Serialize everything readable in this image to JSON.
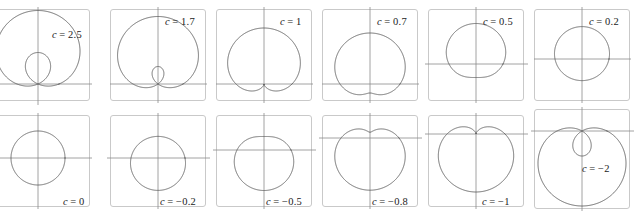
{
  "figure": {
    "width": 636,
    "height": 211,
    "columns": 6,
    "rows": 2,
    "background_color": "#ffffff",
    "curve_color": "#5c5c5c",
    "axis_color": "#8a8a8a",
    "frame_color": "#c9c9c9",
    "label_color": "#1a1a1a"
  },
  "chart_data": {
    "type": "line",
    "xlabel": "",
    "ylabel": "",
    "grid": false,
    "legend_position": "none",
    "equation": "r = 1 + c sin(theta)",
    "parameter_name": "c",
    "panels": [
      {
        "index": 0,
        "label_var": "c",
        "label_eq": "= 2.5",
        "c": 2.5,
        "label_x": 52,
        "label_y": 29,
        "frame": {
          "x": -22,
          "y": 9,
          "w": 112,
          "h": 92
        },
        "origin_x": 38,
        "origin_y": 84,
        "scale": 21,
        "axis_h": {
          "x1": -24,
          "x2": 92,
          "y": 84
        },
        "axis_v": {
          "y1": 7,
          "y2": 105,
          "x": 38
        },
        "shape": "limacon-with-inner-loop"
      },
      {
        "index": 1,
        "label_var": "c",
        "label_eq": "= 1.7",
        "c": 1.7,
        "label_x": 59,
        "label_y": 16,
        "frame": {
          "x": 4,
          "y": 9,
          "w": 96,
          "h": 92
        },
        "origin_x": 52,
        "origin_y": 84,
        "scale": 25,
        "axis_h": {
          "x1": 4,
          "x2": 101,
          "y": 84
        },
        "axis_v": {
          "y1": 7,
          "y2": 103,
          "x": 52
        },
        "shape": "limacon-with-inner-loop"
      },
      {
        "index": 2,
        "label_var": "c",
        "label_eq": "= 1",
        "c": 1.0,
        "label_x": 68,
        "label_y": 16,
        "frame": {
          "x": 4,
          "y": 9,
          "w": 96,
          "h": 92
        },
        "origin_x": 52,
        "origin_y": 84,
        "scale": 28,
        "axis_h": {
          "x1": 4,
          "x2": 101,
          "y": 84
        },
        "axis_v": {
          "y1": 7,
          "y2": 103,
          "x": 52
        },
        "shape": "cardioid"
      },
      {
        "index": 3,
        "label_var": "c",
        "label_eq": "= 0.7",
        "c": 0.7,
        "label_x": 59,
        "label_y": 16,
        "frame": {
          "x": 4,
          "y": 9,
          "w": 96,
          "h": 92
        },
        "origin_x": 52,
        "origin_y": 84,
        "scale": 30,
        "axis_h": {
          "x1": 4,
          "x2": 101,
          "y": 84
        },
        "axis_v": {
          "y1": 7,
          "y2": 103,
          "x": 52
        },
        "shape": "dimpled-limacon"
      },
      {
        "index": 4,
        "label_var": "c",
        "label_eq": "= 0.5",
        "c": 0.5,
        "label_x": 59,
        "label_y": 16,
        "frame": {
          "x": 4,
          "y": 9,
          "w": 96,
          "h": 92
        },
        "origin_x": 52,
        "origin_y": 64,
        "scale": 27,
        "axis_h": {
          "x1": 1,
          "x2": 104,
          "y": 64
        },
        "axis_v": {
          "y1": 7,
          "y2": 103,
          "x": 52
        },
        "shape": "convex-limacon"
      },
      {
        "index": 5,
        "label_var": "c",
        "label_eq": "= 0.2",
        "c": 0.2,
        "label_x": 59,
        "label_y": 16,
        "frame": {
          "x": 4,
          "y": 9,
          "w": 96,
          "h": 92
        },
        "origin_x": 52,
        "origin_y": 59,
        "scale": 27,
        "axis_h": {
          "x1": 4,
          "x2": 101,
          "y": 59
        },
        "axis_v": {
          "y1": 7,
          "y2": 103,
          "x": 52
        },
        "shape": "near-circle"
      },
      {
        "index": 6,
        "label_var": "c",
        "label_eq": "= 0",
        "c": 0.0,
        "label_x": 63,
        "label_y": 90,
        "frame": {
          "x": -22,
          "y": 9,
          "w": 112,
          "h": 92
        },
        "origin_x": 38,
        "origin_y": 52,
        "scale": 27,
        "axis_h": {
          "x1": -24,
          "x2": 92,
          "y": 52
        },
        "axis_v": {
          "y1": 7,
          "y2": 103,
          "x": 38
        },
        "shape": "circle"
      },
      {
        "index": 7,
        "label_var": "c",
        "label_eq": "= −0.2",
        "c": -0.2,
        "label_x": 54,
        "label_y": 90,
        "frame": {
          "x": 4,
          "y": 9,
          "w": 96,
          "h": 92
        },
        "origin_x": 52,
        "origin_y": 52,
        "scale": 27,
        "axis_h": {
          "x1": 1,
          "x2": 104,
          "y": 52
        },
        "axis_v": {
          "y1": 7,
          "y2": 103,
          "x": 52
        },
        "shape": "near-circle"
      },
      {
        "index": 8,
        "label_var": "c",
        "label_eq": "= −0.5",
        "c": -0.5,
        "label_x": 54,
        "label_y": 90,
        "frame": {
          "x": 4,
          "y": 9,
          "w": 96,
          "h": 92
        },
        "origin_x": 52,
        "origin_y": 44,
        "scale": 27,
        "axis_h": {
          "x1": 1,
          "x2": 104,
          "y": 44
        },
        "axis_v": {
          "y1": 7,
          "y2": 103,
          "x": 52
        },
        "shape": "convex-limacon"
      },
      {
        "index": 9,
        "label_var": "c",
        "label_eq": "= −0.8",
        "c": -0.8,
        "label_x": 54,
        "label_y": 90,
        "frame": {
          "x": 4,
          "y": 9,
          "w": 96,
          "h": 92
        },
        "origin_x": 52,
        "origin_y": 32,
        "scale": 29,
        "axis_h": {
          "x1": 1,
          "x2": 104,
          "y": 32
        },
        "axis_v": {
          "y1": 7,
          "y2": 103,
          "x": 52
        },
        "shape": "dimpled-limacon"
      },
      {
        "index": 10,
        "label_var": "c",
        "label_eq": "= −1",
        "c": -1.0,
        "label_x": 58,
        "label_y": 90,
        "frame": {
          "x": 4,
          "y": 9,
          "w": 96,
          "h": 92
        },
        "origin_x": 52,
        "origin_y": 28,
        "scale": 29,
        "axis_h": {
          "x1": 1,
          "x2": 104,
          "y": 28
        },
        "axis_v": {
          "y1": 7,
          "y2": 103,
          "x": 52
        },
        "shape": "cardioid"
      },
      {
        "index": 11,
        "label_var": "c",
        "label_eq": "= −2",
        "c": -2.0,
        "label_x": 52,
        "label_y": 57,
        "frame": {
          "x": 4,
          "y": 3,
          "w": 96,
          "h": 100
        },
        "origin_x": 52,
        "origin_y": 25,
        "scale": 25,
        "axis_h": {
          "x1": 1,
          "x2": 104,
          "y": 25
        },
        "axis_v": {
          "y1": 1,
          "y2": 110,
          "x": 52
        },
        "shape": "limacon-with-inner-loop"
      }
    ]
  }
}
